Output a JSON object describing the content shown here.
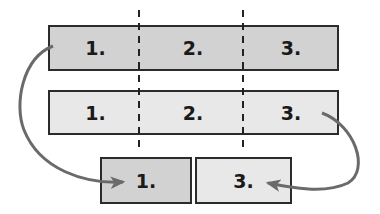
{
  "colors": {
    "dark_fill": "#d2d2d2",
    "light_fill": "#e8e8e8",
    "border": "#2b2b2b",
    "arrow": "#6a6a6a",
    "divider": "#222222"
  },
  "top_bar": {
    "segments": [
      {
        "label": "1."
      },
      {
        "label": "2."
      },
      {
        "label": "3."
      }
    ]
  },
  "middle_bar": {
    "segments": [
      {
        "label": "1."
      },
      {
        "label": "2."
      },
      {
        "label": "3."
      }
    ]
  },
  "bottom_boxes": [
    {
      "label": "1."
    },
    {
      "label": "3."
    }
  ],
  "arrows": [
    {
      "from": "top_bar.segment_1",
      "to": "bottom_boxes.0"
    },
    {
      "from": "middle_bar.segment_3",
      "to": "bottom_boxes.1"
    }
  ]
}
